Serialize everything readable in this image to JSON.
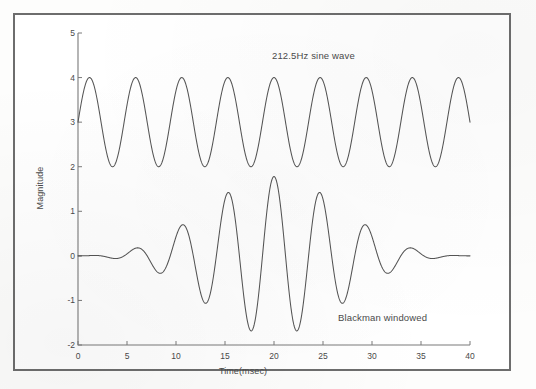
{
  "figure": {
    "frame_color": "#6d6d6d",
    "background": "#ffffff",
    "line_color": "#555555",
    "text_color": "#4a4a4a"
  },
  "annotations": {
    "sine_label": "212.5Hz sine wave",
    "blackman_label": "Blackman windowed"
  },
  "axes": {
    "xlabel": "Time(msec)",
    "ylabel": "Magnitude",
    "xticks": [
      "0",
      "5",
      "10",
      "15",
      "20",
      "25",
      "30",
      "35",
      "40"
    ],
    "yticks": [
      "5",
      "4",
      "3",
      "2",
      "1",
      "0",
      "-1",
      "-2"
    ]
  },
  "chart_data": {
    "type": "line",
    "title": "",
    "xlabel": "Time(msec)",
    "ylabel": "Magnitude",
    "xlim": [
      0,
      40
    ],
    "ylim": [
      -2,
      5
    ],
    "xticks": [
      0,
      5,
      10,
      15,
      20,
      25,
      30,
      35,
      40
    ],
    "yticks": [
      -2,
      -1,
      0,
      1,
      2,
      3,
      4,
      5
    ],
    "grid": false,
    "legend": "none",
    "annotations": [
      {
        "text": "212.5Hz sine wave",
        "x": 20.0,
        "y": 4.6
      },
      {
        "text": "Blackman windowed",
        "x": 27.0,
        "y": -1.4
      }
    ],
    "series": [
      {
        "name": "212.5Hz sine wave",
        "type": "sine",
        "frequency_hz": 212.5,
        "amplitude": 1.0,
        "offset": 3.0,
        "phase_deg": 0,
        "ymin": 2.0,
        "ymax": 4.0,
        "cycles_over_40ms": 8.5,
        "period_ms": 4.7059,
        "color": "#555555"
      },
      {
        "name": "Blackman windowed",
        "type": "windowed-sine",
        "window": "blackman",
        "frequency_hz": 212.5,
        "amplitude": 1.0,
        "offset": 0.0,
        "phase_deg": 0,
        "ymin": -1.7,
        "ymax": 1.78,
        "period_ms": 4.7059,
        "window_span_ms": [
          0,
          40
        ],
        "color": "#555555"
      }
    ]
  }
}
